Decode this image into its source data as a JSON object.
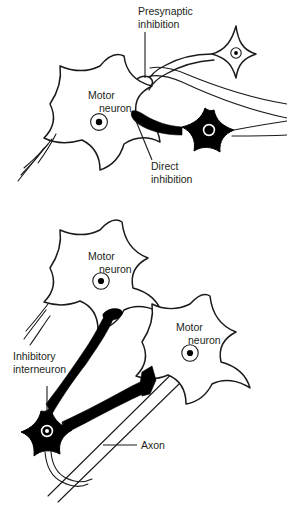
{
  "figure": {
    "background_color": "#ffffff",
    "ink_color": "#1a1a1a",
    "filled_cell_color": "#000000",
    "width": 287,
    "height": 509
  },
  "panels": [
    {
      "id": "top",
      "labels": {
        "presynaptic_inhibition_line1": "Presynaptic",
        "presynaptic_inhibition_line2": "inhibition",
        "motor_neuron_line1": "Motor",
        "motor_neuron_line2": "neuron",
        "direct_inhibition_line1": "Direct",
        "direct_inhibition_line2": "inhibition"
      }
    },
    {
      "id": "bottom",
      "labels": {
        "motor_neuron_upper_line1": "Motor",
        "motor_neuron_upper_line2": "neuron",
        "motor_neuron_right_line1": "Motor",
        "motor_neuron_right_line2": "neuron",
        "inhibitory_interneuron_line1": "Inhibitory",
        "inhibitory_interneuron_line2": "interneuron",
        "axon": "Axon"
      }
    }
  ]
}
